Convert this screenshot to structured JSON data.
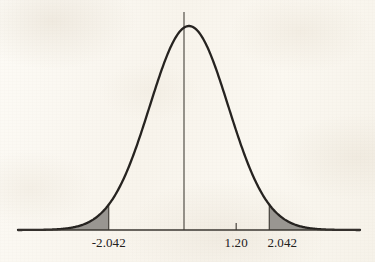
{
  "figure": {
    "background_color": "#faf7ef",
    "curve_color": "#262320",
    "shade_color": "#999691",
    "axis_color": "#3a3630"
  },
  "axis_labels": {
    "left_critical": "-2.042",
    "test_statistic": "1.20",
    "right_critical": "2.042"
  },
  "chart_data": {
    "type": "line",
    "title": "",
    "subtitle": "",
    "xlabel": "",
    "ylabel": "",
    "distribution": "normal",
    "mean": 0,
    "std_dev": 1,
    "xlim": [
      -4.35,
      4.35
    ],
    "ylim": [
      0,
      0.4
    ],
    "grid": false,
    "legend": null,
    "tick_labels": [
      "-2.042",
      "1.20",
      "2.042"
    ],
    "tick_values": [
      -2.042,
      1.2,
      2.042
    ],
    "annotations": [
      {
        "label": "-2.042",
        "x": -2.042,
        "type": "critical-value"
      },
      {
        "label": "1.20",
        "x": 1.2,
        "type": "test-statistic"
      },
      {
        "label": "2.042",
        "x": 2.042,
        "type": "critical-value"
      }
    ],
    "shaded_regions": [
      {
        "name": "left-tail",
        "from": -4.35,
        "to": -2.042,
        "color": "#999691"
      },
      {
        "name": "right-tail",
        "from": 2.042,
        "to": 4.35,
        "color": "#999691"
      }
    ],
    "vertical_lines": [
      {
        "name": "center-line",
        "x": 0,
        "extends_above_curve": true
      },
      {
        "name": "left-critical-line",
        "x": -2.042
      },
      {
        "name": "right-critical-line",
        "x": 2.042
      }
    ],
    "tick_marks": [
      {
        "name": "test-statistic-tick",
        "x": 1.2
      }
    ],
    "x": [
      -4.35,
      -4.0,
      -3.6,
      -3.2,
      -2.8,
      -2.4,
      -2.042,
      -1.8,
      -1.4,
      -1.0,
      -0.6,
      -0.2,
      0,
      0.2,
      0.6,
      1.0,
      1.2,
      1.4,
      1.8,
      2.042,
      2.4,
      2.8,
      3.2,
      3.6,
      4.0,
      4.35
    ],
    "y": [
      0.0001,
      0.0001,
      0.0006,
      0.0024,
      0.0079,
      0.0224,
      0.0498,
      0.079,
      0.1497,
      0.242,
      0.3332,
      0.391,
      0.3989,
      0.391,
      0.3332,
      0.242,
      0.1942,
      0.1497,
      0.079,
      0.0498,
      0.0224,
      0.0079,
      0.0024,
      0.0006,
      0.0001,
      0.0001
    ]
  }
}
